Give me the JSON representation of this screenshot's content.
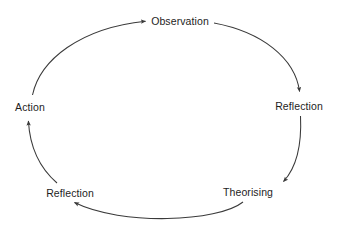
{
  "diagram": {
    "type": "cycle",
    "background_color": "#ffffff",
    "stroke_color": "#3a3a3a",
    "text_color": "#1d1d1d",
    "nodes": [
      {
        "id": "observation",
        "label": "Observation",
        "x": 180,
        "y": 21
      },
      {
        "id": "reflection-right",
        "label": "Reflection",
        "x": 299,
        "y": 106
      },
      {
        "id": "theorising",
        "label": "Theorising",
        "x": 248,
        "y": 192
      },
      {
        "id": "reflection-bottom",
        "label": "Reflection",
        "x": 70,
        "y": 193
      },
      {
        "id": "action",
        "label": "Action",
        "x": 30,
        "y": 107
      }
    ],
    "edges": [
      {
        "id": "action-to-observation",
        "from": "action",
        "to": "observation"
      },
      {
        "id": "observation-to-reflection",
        "from": "observation",
        "to": "reflection-right"
      },
      {
        "id": "reflection-to-theorising",
        "from": "reflection-right",
        "to": "theorising"
      },
      {
        "id": "theorising-to-reflection",
        "from": "theorising",
        "to": "reflection-bottom"
      },
      {
        "id": "reflection-to-action",
        "from": "reflection-bottom",
        "to": "action"
      }
    ]
  }
}
